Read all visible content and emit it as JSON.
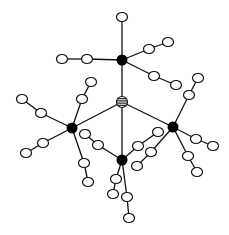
{
  "diagram": {
    "type": "star-branched molecular structure",
    "colors": {
      "line": "#111111",
      "hub": "#000000",
      "open_node": "#ffffff",
      "background": "#ffffff"
    },
    "core": {
      "id": "core",
      "x": 122,
      "y": 102,
      "r": 5.5,
      "style": "striped"
    },
    "hubs": [
      {
        "id": "h_top",
        "x": 122,
        "y": 60
      },
      {
        "id": "h_left",
        "x": 72,
        "y": 128
      },
      {
        "id": "h_bottom",
        "x": 122,
        "y": 160
      },
      {
        "id": "h_right",
        "x": 173,
        "y": 127
      }
    ],
    "hub_radius": 5.5,
    "open_node_rx": 5.5,
    "open_node_ry": 4.5,
    "arms": [
      {
        "hub": "h_top",
        "nodes": [
          [
            122,
            17
          ]
        ]
      },
      {
        "hub": "h_top",
        "nodes": [
          [
            87,
            59
          ],
          [
            62,
            59
          ]
        ]
      },
      {
        "hub": "h_top",
        "nodes": [
          [
            149,
            49
          ],
          [
            168,
            42
          ]
        ]
      },
      {
        "hub": "h_top",
        "nodes": [
          [
            154,
            76
          ],
          [
            176,
            85
          ]
        ]
      },
      {
        "hub": "h_left",
        "nodes": [
          [
            82,
            99
          ],
          [
            91,
            82
          ]
        ]
      },
      {
        "hub": "h_left",
        "nodes": [
          [
            41,
            113
          ],
          [
            22,
            99
          ]
        ]
      },
      {
        "hub": "h_left",
        "nodes": [
          [
            43,
            143
          ],
          [
            26,
            153
          ]
        ]
      },
      {
        "hub": "h_left",
        "nodes": [
          [
            84,
            163
          ],
          [
            88,
            182
          ]
        ]
      },
      {
        "hub": "h_bottom",
        "nodes": [
          [
            98,
            145
          ],
          [
            85,
            134
          ]
        ]
      },
      {
        "hub": "h_bottom",
        "nodes": [
          [
            138,
            146
          ],
          [
            158,
            132
          ]
        ]
      },
      {
        "hub": "h_bottom",
        "nodes": [
          [
            116,
            179
          ],
          [
            113,
            194
          ]
        ]
      },
      {
        "hub": "h_bottom",
        "nodes": [
          [
            127,
            197
          ],
          [
            129,
            218
          ]
        ]
      },
      {
        "hub": "h_right",
        "nodes": [
          [
            189,
            95
          ],
          [
            198,
            78
          ]
        ]
      },
      {
        "hub": "h_right",
        "nodes": [
          [
            151,
            152
          ],
          [
            137,
            166
          ]
        ]
      },
      {
        "hub": "h_right",
        "nodes": [
          [
            196,
            139
          ],
          [
            213,
            146
          ]
        ]
      },
      {
        "hub": "h_right",
        "nodes": [
          [
            188,
            156
          ],
          [
            197,
            172
          ]
        ]
      }
    ]
  }
}
